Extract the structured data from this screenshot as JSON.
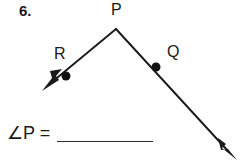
{
  "page": {
    "background_color": "#ffffff",
    "ink_color": "#1a1a1a",
    "width": 242,
    "height": 163
  },
  "problem": {
    "number_label": "6.",
    "type": "geometry-angle-measure",
    "prompt_expression": "∠P =",
    "answer_value": ""
  },
  "figure": {
    "kind": "angle-with-two-rays",
    "vertex": {
      "name": "P",
      "label": "P",
      "x": 116,
      "y": 29,
      "label_x": 111,
      "label_y": 2
    },
    "rays": [
      {
        "name": "ray-PR",
        "label": "R",
        "point_label": "R",
        "label_x": 54,
        "label_y": 46,
        "from_x": 116,
        "from_y": 29,
        "to_x": 44,
        "to_y": 89,
        "dot_x": 66,
        "dot_y": 76,
        "arrowhead": "filled-triangle",
        "direction": "down-left"
      },
      {
        "name": "ray-PQ",
        "label": "Q",
        "point_label": "Q",
        "label_x": 167,
        "label_y": 44,
        "from_x": 116,
        "from_y": 29,
        "to_x": 236,
        "to_y": 159,
        "dot_x": 156,
        "dot_y": 67,
        "arrowhead": "filled-triangle",
        "direction": "down-right"
      }
    ],
    "stroke_color": "#1a1a1a",
    "stroke_width": 1.8,
    "dot_color": "#111111",
    "dot_radius": 4.4
  },
  "answer_line": {
    "x_start": 57,
    "x_end": 153,
    "y": 143,
    "color": "#2b2b2b"
  }
}
